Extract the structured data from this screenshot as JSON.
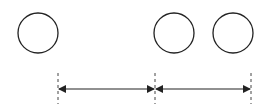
{
  "diagram": {
    "circles": [
      {
        "cx": 38,
        "cy": 33,
        "r": 20
      },
      {
        "cx": 174,
        "cy": 33,
        "r": 20
      },
      {
        "cx": 233,
        "cy": 33,
        "r": 20
      }
    ],
    "guides": [
      {
        "x": 58,
        "y1": 73,
        "y2": 104
      },
      {
        "x": 155,
        "y1": 73,
        "y2": 104
      },
      {
        "x": 251,
        "y1": 73,
        "y2": 104
      }
    ],
    "arrows": [
      {
        "x1": 58,
        "x2": 155,
        "y": 89
      },
      {
        "x1": 155,
        "x2": 251,
        "y": 89
      }
    ],
    "colors": {
      "stroke": "#222222",
      "dash": "#444444",
      "background": "#ffffff"
    }
  }
}
